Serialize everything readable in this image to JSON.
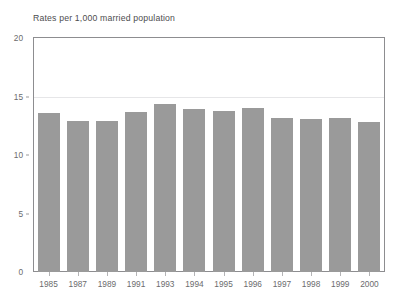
{
  "chart_data": {
    "type": "bar",
    "title": "Rates per 1,000 married population",
    "xlabel": "",
    "ylabel": "",
    "categories": [
      "1985",
      "1987",
      "1989",
      "1991",
      "1993",
      "1994",
      "1995",
      "1996",
      "1997",
      "1998",
      "1999",
      "2000"
    ],
    "values": [
      13.6,
      12.9,
      12.9,
      13.7,
      14.4,
      13.9,
      13.8,
      14.0,
      13.2,
      13.1,
      13.2,
      12.8
    ],
    "series": [
      {
        "name": "Rates per 1,000 married population",
        "values": [
          13.6,
          12.9,
          12.9,
          13.7,
          14.4,
          13.9,
          13.8,
          14.0,
          13.2,
          13.1,
          13.2,
          12.8
        ]
      }
    ],
    "ylim": [
      0,
      20
    ],
    "yticks": [
      0,
      5,
      10,
      15,
      20
    ],
    "ytick_labels": [
      "0",
      "5",
      "10",
      "15",
      "20"
    ],
    "gridlines": [
      15
    ],
    "grid": true,
    "legend": "none",
    "bar_color": "#9a9a9a",
    "frame_color": "#8d8d90",
    "gridline_color": "#e6e6e8",
    "text_color": "#6b6b6d",
    "background": "#ffffff"
  }
}
